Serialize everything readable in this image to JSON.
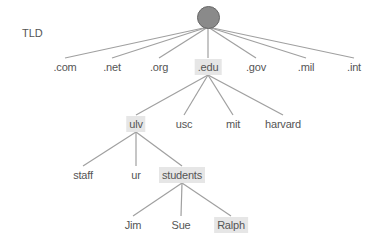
{
  "diagram": {
    "level_label": "TLD",
    "root": {
      "name": "root",
      "x": 208,
      "y": 17
    },
    "colors": {
      "edge": "#a0a0a0",
      "root_fill": "#8a8a8a",
      "highlight": "#e6e6e6",
      "text": "#555555"
    },
    "nodes": [
      {
        "id": "com",
        "label": ".com",
        "x": 65,
        "y": 67,
        "highlight": false,
        "parent": "root"
      },
      {
        "id": "net",
        "label": ".net",
        "x": 112,
        "y": 67,
        "highlight": false,
        "parent": "root"
      },
      {
        "id": "org",
        "label": ".org",
        "x": 159,
        "y": 67,
        "highlight": false,
        "parent": "root"
      },
      {
        "id": "edu",
        "label": ".edu",
        "x": 208,
        "y": 67,
        "highlight": true,
        "parent": "root"
      },
      {
        "id": "gov",
        "label": ".gov",
        "x": 256,
        "y": 67,
        "highlight": false,
        "parent": "root"
      },
      {
        "id": "mil",
        "label": ".mil",
        "x": 306,
        "y": 67,
        "highlight": false,
        "parent": "root"
      },
      {
        "id": "int",
        "label": ".int",
        "x": 354,
        "y": 67,
        "highlight": false,
        "parent": "root"
      },
      {
        "id": "ulv",
        "label": "ulv",
        "x": 136,
        "y": 124,
        "highlight": true,
        "parent": "edu"
      },
      {
        "id": "usc",
        "label": "usc",
        "x": 184,
        "y": 124,
        "highlight": false,
        "parent": "edu"
      },
      {
        "id": "mit",
        "label": "mit",
        "x": 233,
        "y": 124,
        "highlight": false,
        "parent": "edu"
      },
      {
        "id": "harvard",
        "label": "harvard",
        "x": 283,
        "y": 124,
        "highlight": false,
        "parent": "edu"
      },
      {
        "id": "staff",
        "label": "staff",
        "x": 83,
        "y": 175,
        "highlight": false,
        "parent": "ulv"
      },
      {
        "id": "ur",
        "label": "ur",
        "x": 136,
        "y": 175,
        "highlight": false,
        "parent": "ulv"
      },
      {
        "id": "students",
        "label": "students",
        "x": 182,
        "y": 175,
        "highlight": true,
        "parent": "ulv"
      },
      {
        "id": "jim",
        "label": "Jim",
        "x": 133,
        "y": 225,
        "highlight": false,
        "parent": "students"
      },
      {
        "id": "sue",
        "label": "Sue",
        "x": 181,
        "y": 225,
        "highlight": false,
        "parent": "students"
      },
      {
        "id": "ralph",
        "label": "Ralph",
        "x": 231,
        "y": 225,
        "highlight": true,
        "parent": "students"
      }
    ]
  }
}
